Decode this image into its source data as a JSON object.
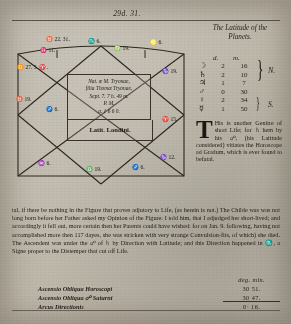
{
  "page": {
    "top_number": "29d. 31.",
    "latitudes_heading_line1": "The Latitude of the",
    "latitudes_heading_line2": "Planets."
  },
  "latitude_table": {
    "col_d": "d.",
    "col_m": "m.",
    "north_label": "N.",
    "south_label": "S.",
    "rows": [
      {
        "planet_symbol": "☽",
        "planet_name": "moon",
        "d": "2",
        "m": "16"
      },
      {
        "planet_symbol": "♄",
        "planet_name": "saturn",
        "d": "2",
        "m": "10"
      },
      {
        "planet_symbol": "♃",
        "planet_name": "jupiter",
        "d": "1",
        "m": "7"
      },
      {
        "planet_symbol": "♂",
        "planet_name": "mars",
        "d": "0",
        "m": "30"
      },
      {
        "planet_symbol": "♀",
        "planet_name": "venus",
        "d": "2",
        "m": "34"
      },
      {
        "planet_symbol": "☿",
        "planet_name": "mercury",
        "d": "1",
        "m": "50"
      }
    ]
  },
  "chart": {
    "nativity": {
      "line1": "Nat. œ M. Tryonae,",
      "line2": "filia Thomæ Tryonae,",
      "line3": "Sept. 7. 7 h. 49 m.",
      "line4": "P. M.",
      "line5": "ɑ. 1 6 6 0."
    },
    "latitude_label": "Latit. Londini.",
    "cusp_labels": [
      {
        "text": "♉ 22. 31.",
        "x": 36,
        "y": 12
      },
      {
        "text": "♓ 11.",
        "x": 30,
        "y": 23
      },
      {
        "text": "♏ 6.",
        "x": 78,
        "y": 14
      },
      {
        "text": "♍ 19.",
        "x": 104,
        "y": 21
      },
      {
        "text": "♌ 6.",
        "x": 140,
        "y": 15
      },
      {
        "text": "♊ 27. 5. ♈.",
        "x": 7,
        "y": 40
      },
      {
        "text": "♉ 19.",
        "x": 6,
        "y": 72
      },
      {
        "text": "♐ 6.",
        "x": 36,
        "y": 82
      },
      {
        "text": "♑ 19.",
        "x": 152,
        "y": 44
      },
      {
        "text": "♈ 15.",
        "x": 152,
        "y": 92
      },
      {
        "text": "♒ 6.",
        "x": 28,
        "y": 136
      },
      {
        "text": "♎ 19.",
        "x": 76,
        "y": 142
      },
      {
        "text": "♐ 6.",
        "x": 122,
        "y": 140
      },
      {
        "text": "♑ 12.",
        "x": 150,
        "y": 130
      }
    ]
  },
  "article": {
    "dropcap": "T",
    "text": "His is another Genitre of short Life; for ♄ hem by his ☍, (his Latitude considered) vitiates the Horoscope ad Gradum, which is ever found to befatal."
  },
  "body": {
    "paragraph": "tal, if there be nothing in the Figure that proves adjutory to Life, (as herein is not.) The Childe was was not long born before her Father asked my Opinion of the Figure: I told him, that I adjudged her short-lived; and accordingly it fell out, more certain then her Parents could have wished: for on Jan. 9. following, having not accomplished more then 117 dayes, she was stricken with very strange Convulsion-fits, of which) she died. The Ascendent was under the ☍ of ♄ by Direction with Latitude; and this Direction happened in ♏, a Signe proper to the Distemper that cut off Life."
  },
  "calc": {
    "deg_header": "deg. min.",
    "rows": [
      {
        "label": "Ascensio Obliqua Horoscopi",
        "value": "30  51."
      },
      {
        "label": "Ascensio Obliqua ☍ Saturni",
        "value": "30  47."
      },
      {
        "label": "Arcus Directionis",
        "value": "0· 16."
      }
    ]
  }
}
